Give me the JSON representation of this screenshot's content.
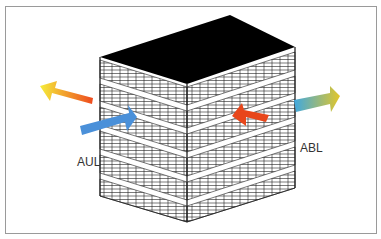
{
  "diagram": {
    "type": "building-ventilation-airflow",
    "labels": {
      "supply_outdoor_air": "AUL",
      "exhaust_air": "ABL"
    },
    "colors": {
      "roof": "#000000",
      "grid_lines": "#1a1a1a",
      "frame_border": "#9a9a9a",
      "arrow_blue": "#4a90d9",
      "arrow_red": "#e8461a",
      "arrow_gradient_warm_start": "#f5e63a",
      "arrow_gradient_warm_end": "#ee4a1e",
      "arrow_gradient_cool_start": "#3fa8e0",
      "arrow_gradient_cool_end": "#e2c62a"
    },
    "arrows": [
      {
        "name": "warm-exhaust-left",
        "direction": "out-left",
        "gradient": "yellow-to-red"
      },
      {
        "name": "outdoor-air-in",
        "direction": "in-right",
        "color": "blue",
        "label": "AUL"
      },
      {
        "name": "indoor-air-in",
        "direction": "in-left",
        "color": "red"
      },
      {
        "name": "exhaust-out-right",
        "direction": "out-right",
        "gradient": "blue-to-yellow",
        "label": "ABL"
      }
    ]
  }
}
